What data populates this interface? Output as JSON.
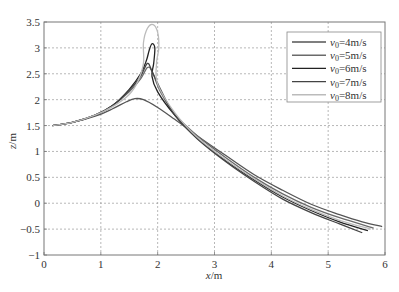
{
  "chart_data": {
    "type": "line",
    "title": "",
    "xlabel": "x/m",
    "ylabel": "z/m",
    "xlim": [
      0,
      6
    ],
    "ylim": [
      -1,
      3.5
    ],
    "xticks": [
      "0",
      "1",
      "2",
      "3",
      "4",
      "5",
      "6"
    ],
    "yticks": [
      "-1",
      "-0.5",
      "0",
      "0.5",
      "1",
      "1.5",
      "2",
      "2.5",
      "3",
      "3.5"
    ],
    "grid": true,
    "legend_position": "upper right",
    "series": [
      {
        "name": "v0=4m/s",
        "color": "#555555",
        "points": [
          [
            0.15,
            1.5
          ],
          [
            0.5,
            1.56
          ],
          [
            0.9,
            1.68
          ],
          [
            1.2,
            1.82
          ],
          [
            1.45,
            1.96
          ],
          [
            1.6,
            2.02
          ],
          [
            1.75,
            2.0
          ],
          [
            2.0,
            1.85
          ],
          [
            2.3,
            1.62
          ],
          [
            2.7,
            1.3
          ],
          [
            3.2,
            0.92
          ],
          [
            3.7,
            0.55
          ],
          [
            4.2,
            0.25
          ],
          [
            4.7,
            -0.02
          ],
          [
            5.2,
            -0.22
          ],
          [
            5.6,
            -0.36
          ],
          [
            5.95,
            -0.45
          ]
        ]
      },
      {
        "name": "v0=5m/s",
        "color": "#6a6a6a",
        "points": [
          [
            0.15,
            1.5
          ],
          [
            0.5,
            1.56
          ],
          [
            0.9,
            1.7
          ],
          [
            1.2,
            1.88
          ],
          [
            1.5,
            2.15
          ],
          [
            1.7,
            2.4
          ],
          [
            1.82,
            2.62
          ],
          [
            1.9,
            2.55
          ],
          [
            2.05,
            2.15
          ],
          [
            2.3,
            1.72
          ],
          [
            2.7,
            1.3
          ],
          [
            3.2,
            0.88
          ],
          [
            3.7,
            0.5
          ],
          [
            4.2,
            0.18
          ],
          [
            4.7,
            -0.08
          ],
          [
            5.2,
            -0.28
          ],
          [
            5.8,
            -0.48
          ]
        ]
      },
      {
        "name": "v0=6m/s",
        "color": "#222222",
        "points": [
          [
            0.15,
            1.5
          ],
          [
            0.5,
            1.56
          ],
          [
            0.9,
            1.7
          ],
          [
            1.2,
            1.88
          ],
          [
            1.5,
            2.2
          ],
          [
            1.7,
            2.5
          ],
          [
            1.8,
            2.75
          ],
          [
            1.85,
            2.95
          ],
          [
            1.9,
            3.08
          ],
          [
            1.95,
            3.0
          ],
          [
            1.93,
            2.7
          ],
          [
            1.9,
            2.45
          ],
          [
            2.0,
            2.15
          ],
          [
            2.3,
            1.7
          ],
          [
            2.7,
            1.25
          ],
          [
            3.2,
            0.82
          ],
          [
            3.7,
            0.45
          ],
          [
            4.2,
            0.12
          ],
          [
            4.7,
            -0.14
          ],
          [
            5.2,
            -0.36
          ],
          [
            5.7,
            -0.53
          ]
        ]
      },
      {
        "name": "v0=7m/s",
        "color": "#444444",
        "points": [
          [
            0.15,
            1.5
          ],
          [
            0.5,
            1.56
          ],
          [
            0.9,
            1.7
          ],
          [
            1.2,
            1.88
          ],
          [
            1.5,
            2.18
          ],
          [
            1.7,
            2.45
          ],
          [
            1.82,
            2.7
          ],
          [
            1.9,
            2.55
          ],
          [
            2.05,
            2.2
          ],
          [
            2.3,
            1.7
          ],
          [
            2.7,
            1.24
          ],
          [
            3.2,
            0.8
          ],
          [
            3.7,
            0.42
          ],
          [
            4.2,
            0.08
          ],
          [
            4.7,
            -0.18
          ],
          [
            5.2,
            -0.4
          ],
          [
            5.6,
            -0.57
          ]
        ]
      },
      {
        "name": "v0=8m/s",
        "color": "#bbbbbb",
        "points": [
          [
            0.15,
            1.5
          ],
          [
            0.5,
            1.56
          ],
          [
            0.9,
            1.7
          ],
          [
            1.2,
            1.86
          ],
          [
            1.5,
            2.1
          ],
          [
            1.65,
            2.35
          ],
          [
            1.75,
            2.7
          ],
          [
            1.75,
            3.1
          ],
          [
            1.82,
            3.38
          ],
          [
            1.92,
            3.45
          ],
          [
            2.0,
            3.3
          ],
          [
            2.02,
            3.0
          ],
          [
            1.98,
            2.7
          ],
          [
            2.0,
            2.3
          ],
          [
            2.3,
            1.75
          ],
          [
            2.7,
            1.27
          ],
          [
            3.2,
            0.84
          ],
          [
            3.7,
            0.47
          ],
          [
            4.2,
            0.14
          ],
          [
            4.7,
            -0.12
          ],
          [
            5.2,
            -0.33
          ],
          [
            5.75,
            -0.5
          ]
        ]
      }
    ]
  },
  "axes": {
    "x_label_italic": "x",
    "x_label_unit": "/m",
    "y_label_italic": "z",
    "y_label_unit": "/m"
  },
  "legend": {
    "items": [
      {
        "prefix": "v",
        "sub": "0",
        "suffix": "=4m/s"
      },
      {
        "prefix": "v",
        "sub": "0",
        "suffix": "=5m/s"
      },
      {
        "prefix": "v",
        "sub": "0",
        "suffix": "=6m/s"
      },
      {
        "prefix": "v",
        "sub": "0",
        "suffix": "=7m/s"
      },
      {
        "prefix": "v",
        "sub": "0",
        "suffix": "=8m/s"
      }
    ]
  }
}
